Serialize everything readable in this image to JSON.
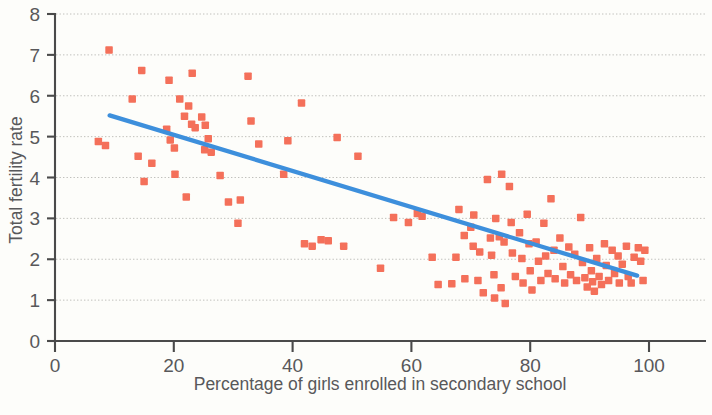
{
  "chart_data": {
    "type": "scatter",
    "title": "",
    "xlabel": "Percentage of girls enrolled in secondary school",
    "ylabel": "Total fertility rate",
    "xlim": [
      0,
      108
    ],
    "ylim": [
      0,
      8
    ],
    "xticks": [
      0,
      20,
      40,
      60,
      80,
      100
    ],
    "yticks": [
      0,
      1,
      2,
      3,
      4,
      5,
      6,
      7,
      8
    ],
    "xtick_labels": [
      "0",
      "20",
      "40",
      "60",
      "80",
      "100"
    ],
    "ytick_labels": [
      "0",
      "1",
      "2",
      "3",
      "4",
      "5",
      "6",
      "7",
      "8"
    ],
    "grid": "horizontal-dotted",
    "legend": "none",
    "marker_shape": "square",
    "marker_color": "#f4705a",
    "marker_size_px": 7.5,
    "trendline": {
      "type": "linear",
      "color": "#3d8fdc",
      "x_start": 9.2,
      "y_start": 5.52,
      "x_end": 98.0,
      "y_end": 1.6
    },
    "points": [
      [
        9.1,
        7.12
      ],
      [
        7.3,
        4.88
      ],
      [
        8.5,
        4.78
      ],
      [
        13.0,
        5.92
      ],
      [
        14.6,
        6.62
      ],
      [
        14.0,
        4.52
      ],
      [
        15.0,
        3.9
      ],
      [
        16.3,
        4.35
      ],
      [
        19.2,
        6.38
      ],
      [
        18.8,
        5.18
      ],
      [
        19.4,
        4.92
      ],
      [
        20.1,
        4.72
      ],
      [
        20.2,
        4.08
      ],
      [
        21.0,
        5.92
      ],
      [
        21.8,
        5.5
      ],
      [
        22.5,
        5.75
      ],
      [
        23.1,
        6.55
      ],
      [
        23.0,
        5.3
      ],
      [
        23.6,
        5.22
      ],
      [
        24.7,
        5.48
      ],
      [
        25.3,
        5.28
      ],
      [
        25.2,
        4.68
      ],
      [
        26.3,
        4.62
      ],
      [
        25.8,
        4.95
      ],
      [
        22.1,
        3.52
      ],
      [
        27.8,
        4.05
      ],
      [
        29.2,
        3.4
      ],
      [
        31.2,
        3.45
      ],
      [
        30.8,
        2.88
      ],
      [
        32.5,
        6.48
      ],
      [
        33.0,
        5.38
      ],
      [
        34.3,
        4.82
      ],
      [
        38.5,
        4.08
      ],
      [
        39.2,
        4.9
      ],
      [
        41.5,
        5.82
      ],
      [
        42.0,
        2.38
      ],
      [
        43.3,
        2.32
      ],
      [
        44.8,
        2.48
      ],
      [
        46.0,
        2.45
      ],
      [
        47.5,
        4.98
      ],
      [
        48.6,
        2.32
      ],
      [
        51.0,
        4.52
      ],
      [
        54.8,
        1.78
      ],
      [
        57.0,
        3.02
      ],
      [
        59.5,
        2.9
      ],
      [
        61.0,
        3.12
      ],
      [
        61.8,
        3.05
      ],
      [
        63.5,
        2.05
      ],
      [
        64.5,
        1.38
      ],
      [
        66.8,
        1.4
      ],
      [
        67.5,
        2.05
      ],
      [
        68.0,
        3.22
      ],
      [
        68.9,
        2.58
      ],
      [
        69.0,
        1.52
      ],
      [
        70.0,
        2.78
      ],
      [
        70.5,
        3.08
      ],
      [
        70.4,
        2.32
      ],
      [
        71.5,
        2.18
      ],
      [
        71.2,
        1.48
      ],
      [
        72.1,
        1.18
      ],
      [
        72.8,
        3.95
      ],
      [
        73.3,
        2.52
      ],
      [
        73.5,
        2.1
      ],
      [
        73.9,
        1.62
      ],
      [
        74.2,
        3.0
      ],
      [
        74.0,
        1.05
      ],
      [
        74.8,
        2.55
      ],
      [
        75.2,
        4.08
      ],
      [
        75.6,
        2.42
      ],
      [
        75.1,
        1.3
      ],
      [
        75.8,
        0.92
      ],
      [
        76.5,
        3.78
      ],
      [
        76.8,
        2.9
      ],
      [
        77.0,
        2.15
      ],
      [
        77.5,
        1.58
      ],
      [
        78.2,
        2.65
      ],
      [
        78.6,
        2.02
      ],
      [
        78.8,
        1.42
      ],
      [
        79.5,
        3.1
      ],
      [
        79.8,
        2.38
      ],
      [
        80.0,
        1.72
      ],
      [
        80.3,
        1.25
      ],
      [
        81.0,
        2.42
      ],
      [
        81.4,
        1.95
      ],
      [
        81.8,
        1.48
      ],
      [
        82.3,
        2.88
      ],
      [
        82.6,
        2.08
      ],
      [
        83.0,
        1.65
      ],
      [
        83.5,
        3.48
      ],
      [
        84.0,
        2.22
      ],
      [
        84.2,
        1.52
      ],
      [
        85.0,
        2.52
      ],
      [
        85.5,
        1.82
      ],
      [
        85.8,
        1.42
      ],
      [
        86.5,
        2.3
      ],
      [
        86.8,
        1.62
      ],
      [
        87.5,
        2.12
      ],
      [
        87.8,
        1.48
      ],
      [
        88.5,
        3.02
      ],
      [
        88.8,
        1.92
      ],
      [
        89.2,
        1.55
      ],
      [
        89.6,
        1.32
      ],
      [
        90.0,
        2.28
      ],
      [
        90.3,
        1.72
      ],
      [
        90.5,
        1.45
      ],
      [
        90.8,
        1.22
      ],
      [
        91.2,
        2.02
      ],
      [
        91.6,
        1.58
      ],
      [
        92.0,
        1.38
      ],
      [
        92.5,
        2.38
      ],
      [
        92.8,
        1.85
      ],
      [
        93.2,
        1.48
      ],
      [
        93.8,
        2.22
      ],
      [
        94.2,
        1.65
      ],
      [
        94.8,
        2.08
      ],
      [
        95.0,
        1.42
      ],
      [
        95.5,
        1.88
      ],
      [
        96.2,
        2.32
      ],
      [
        96.5,
        1.58
      ],
      [
        97.0,
        1.42
      ],
      [
        97.5,
        2.05
      ],
      [
        98.2,
        2.28
      ],
      [
        98.6,
        1.95
      ],
      [
        99.0,
        1.48
      ],
      [
        99.3,
        2.22
      ]
    ]
  }
}
